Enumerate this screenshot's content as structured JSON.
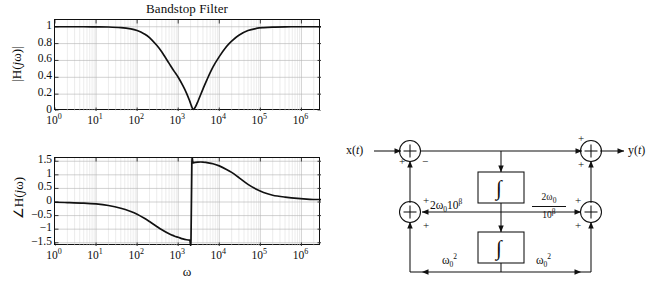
{
  "chart_data": [
    {
      "type": "line",
      "title": "Bandstop Filter",
      "xlabel": "",
      "ylabel": "|H( jω)|",
      "xscale": "log",
      "xlim": [
        1,
        3000000
      ],
      "ylim": [
        0,
        1.08
      ],
      "grid": true,
      "legend": null,
      "xticklabels": [
        "10",
        "10",
        "10",
        "10",
        "10",
        "10",
        "10"
      ],
      "xtickexponents": [
        "0",
        "1",
        "2",
        "3",
        "4",
        "5",
        "6"
      ],
      "xtickvalues": [
        1,
        10,
        100,
        1000,
        10000,
        100000,
        1000000
      ],
      "yticklabels": [
        "0",
        "0.2",
        "0.4",
        "0.6",
        "0.8",
        "1"
      ],
      "ytickvalues": [
        0,
        0.2,
        0.4,
        0.6,
        0.8,
        1
      ],
      "series": [
        {
          "name": "magnitude",
          "x": [
            1,
            2,
            5,
            10,
            20,
            40,
            70,
            100,
            150,
            200,
            300,
            400,
            600,
            800,
            1000,
            1300,
            1600,
            1900,
            2100,
            2300,
            2600,
            3000,
            4000,
            5000,
            7000,
            10000,
            15000,
            20000,
            30000,
            50000,
            80000,
            120000,
            200000,
            400000,
            800000,
            1600000,
            3000000
          ],
          "y": [
            1.0,
            1.0,
            1.0,
            0.999,
            0.997,
            0.99,
            0.975,
            0.955,
            0.915,
            0.872,
            0.78,
            0.7,
            0.565,
            0.47,
            0.4,
            0.3,
            0.21,
            0.12,
            0.06,
            0.02,
            0.045,
            0.11,
            0.26,
            0.37,
            0.52,
            0.645,
            0.765,
            0.83,
            0.9,
            0.955,
            0.98,
            0.99,
            0.996,
            0.999,
            1.0,
            1.0,
            1.0
          ]
        }
      ]
    },
    {
      "type": "line",
      "title": "",
      "xlabel": "ω",
      "ylabel": "∠H( jω)",
      "xscale": "log",
      "xlim": [
        1,
        3000000
      ],
      "ylim": [
        -1.62,
        1.62
      ],
      "grid": true,
      "legend": null,
      "xticklabels": [
        "10",
        "10",
        "10",
        "10",
        "10",
        "10",
        "10"
      ],
      "xtickexponents": [
        "0",
        "1",
        "2",
        "3",
        "4",
        "5",
        "6"
      ],
      "xtickvalues": [
        1,
        10,
        100,
        1000,
        10000,
        100000,
        1000000
      ],
      "yticklabels": [
        "−1.5",
        "−1",
        "−0.5",
        "0",
        "0.5",
        "1",
        "1.5"
      ],
      "ytickvalues": [
        -1.5,
        -1,
        -0.5,
        0,
        0.5,
        1,
        1.5
      ],
      "series": [
        {
          "name": "phase",
          "x": [
            1,
            2,
            5,
            10,
            20,
            40,
            70,
            100,
            150,
            200,
            300,
            400,
            600,
            800,
            1000,
            1300,
            1600,
            1900,
            2050,
            2150,
            2300,
            2600,
            3000,
            4000,
            5000,
            7000,
            10000,
            15000,
            20000,
            30000,
            50000,
            80000,
            120000,
            200000,
            400000,
            800000,
            1600000,
            3000000
          ],
          "y": [
            -0.01,
            -0.02,
            -0.04,
            -0.07,
            -0.13,
            -0.23,
            -0.35,
            -0.45,
            -0.6,
            -0.72,
            -0.9,
            -1.02,
            -1.17,
            -1.25,
            -1.3,
            -1.36,
            -1.39,
            -1.4,
            -1.38,
            1.4,
            1.44,
            1.46,
            1.47,
            1.47,
            1.45,
            1.41,
            1.33,
            1.2,
            1.09,
            0.9,
            0.65,
            0.47,
            0.35,
            0.25,
            0.18,
            0.13,
            0.1,
            0.09
          ]
        }
      ]
    }
  ],
  "plots": {
    "title": "Bandstop Filter",
    "magnitude": {
      "ylabel_pre": "|H(",
      "ylabel_j": "j",
      "ylabel_post": "ω)|",
      "yticks": [
        "1",
        "0.8",
        "0.6",
        "0.4",
        "0.2",
        "0"
      ]
    },
    "phase": {
      "ylabel_pre": "∠H(",
      "ylabel_j": "j",
      "ylabel_post": "ω)",
      "yticks": [
        "1.5",
        "1",
        "0.5",
        "0",
        "−0.5",
        "−1",
        "−1.5"
      ]
    },
    "xticks": [
      {
        "mantissa": "10",
        "exp": "0"
      },
      {
        "mantissa": "10",
        "exp": "1"
      },
      {
        "mantissa": "10",
        "exp": "2"
      },
      {
        "mantissa": "10",
        "exp": "3"
      },
      {
        "mantissa": "10",
        "exp": "4"
      },
      {
        "mantissa": "10",
        "exp": "5"
      },
      {
        "mantissa": "10",
        "exp": "6"
      }
    ],
    "xaxis_label": "ω"
  },
  "diagram": {
    "input_label_x": "x(",
    "input_label_t": "t",
    "input_label_close": ")",
    "output_label_y": "y(",
    "output_label_t": "t",
    "output_label_close": ")",
    "integrator_symbol": "∫",
    "gain_left_top": "2ω",
    "gain_left_top_sub": "0",
    "gain_left_top_rest": "10",
    "gain_left_top_sup": "β",
    "gain_right_top_num_a": "2ω",
    "gain_right_top_num_sub": "0",
    "gain_right_top_den_a": "10",
    "gain_right_top_den_sup": "β",
    "gain_bottom_left": "ω",
    "gain_bottom_left_sub": "0",
    "gain_bottom_left_sup": "2",
    "gain_bottom_right": "ω",
    "gain_bottom_right_sub": "0",
    "gain_bottom_right_sup": "2",
    "summer_symbol": "+",
    "signs": {
      "s1_left": "+",
      "s1_bottom": "−",
      "s2_topleft": "+",
      "s2_bottomleft": "+",
      "s3_topright": "+",
      "s3_bottomright": "+",
      "s4_topleft": "+",
      "s4_bottomleft": "+"
    }
  },
  "colors": {
    "curve": "#111111",
    "axis": "#111111",
    "grid_major": "#b4b4b4",
    "grid_minor": "#d8d8d8",
    "background": "#ffffff"
  }
}
